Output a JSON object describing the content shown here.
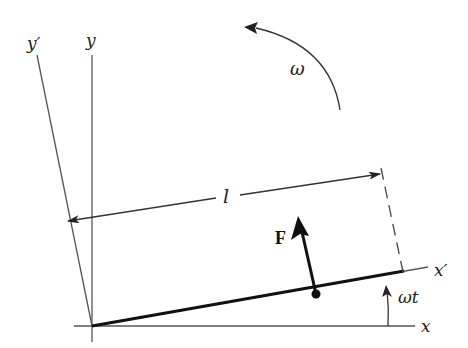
{
  "labels": {
    "y_prime": "y′",
    "y": "y",
    "omega": "ω",
    "length": "l",
    "force": "F",
    "x_prime": "x′",
    "omega_t": "ωt",
    "x": "x"
  },
  "colors": {
    "line": "#444444",
    "thick": "#111111",
    "background": "#ffffff"
  }
}
